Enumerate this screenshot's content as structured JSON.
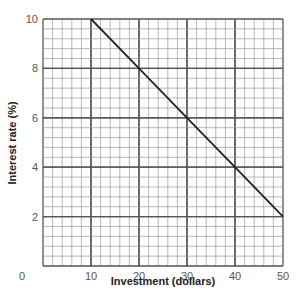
{
  "chart_data": {
    "type": "line",
    "title": "",
    "xlabel": "Investment (dollars)",
    "ylabel": "Interest rate (%)",
    "xlim": [
      0,
      50
    ],
    "ylim": [
      0,
      10
    ],
    "x_ticks": [
      0,
      10,
      20,
      30,
      40,
      50
    ],
    "y_ticks": [
      2,
      4,
      6,
      8,
      10
    ],
    "grid": true,
    "minor_grid_per_major": 5,
    "legend": null,
    "series": [
      {
        "name": "Investment demand",
        "x": [
          10,
          20,
          30,
          40,
          50
        ],
        "y": [
          10,
          8,
          6,
          4,
          2
        ]
      }
    ]
  },
  "colors": {
    "line": "#222222",
    "major_grid": "#555555",
    "minor_grid": "#999999",
    "tick_text": "#555555"
  }
}
